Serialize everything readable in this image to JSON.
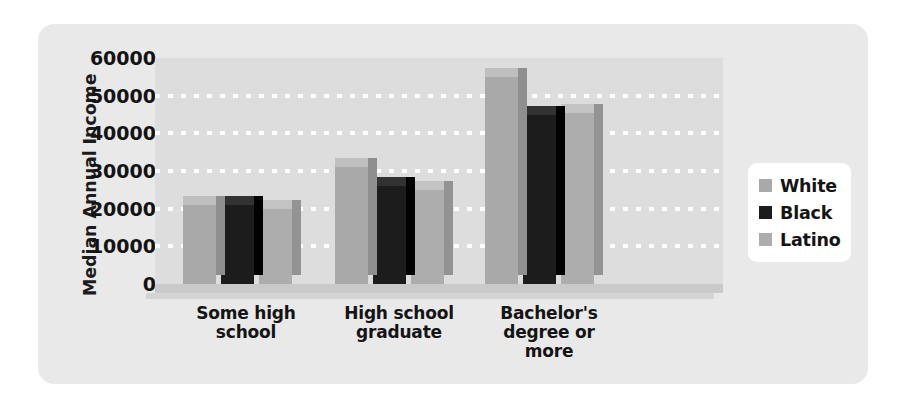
{
  "chart_data": {
    "type": "bar",
    "title": "",
    "xlabel": "",
    "ylabel": "Median Annual Income",
    "ylim": [
      0,
      60000
    ],
    "yticks": [
      60000,
      50000,
      40000,
      30000,
      20000,
      10000,
      0
    ],
    "ytick_labels": [
      "60000",
      "50000",
      "40000",
      "30000",
      "20000",
      "10000",
      "0"
    ],
    "grid": true,
    "grid_axis": "y",
    "grid_style": "dotted-white",
    "legend_position": "right",
    "three_d": true,
    "categories": [
      "Some high school",
      "High school graduate",
      "Bachelor's degree or more"
    ],
    "category_lines": [
      [
        "Some high",
        "school"
      ],
      [
        "High school",
        "graduate"
      ],
      [
        "Bachelor's",
        "degree or",
        "more"
      ]
    ],
    "series": [
      {
        "name": "White",
        "color": "#a9a9a9",
        "values": [
          21000,
          31000,
          55000
        ]
      },
      {
        "name": "Black",
        "color": "#1c1c1c",
        "values": [
          21000,
          26000,
          45000
        ]
      },
      {
        "name": "Latino",
        "color": "#adadad",
        "values": [
          20000,
          25000,
          45500
        ]
      }
    ]
  },
  "legend": {
    "entries": [
      {
        "label": "White"
      },
      {
        "label": "Black"
      },
      {
        "label": "Latino"
      }
    ]
  },
  "colors": {
    "card_background": "#e9e9e9",
    "plot_background": "#dddddd",
    "gridline": "#ffffff",
    "text": "#141414",
    "legend_background": "#ffffff",
    "white_series": "#a9a9a9",
    "black_series": "#1c1c1c",
    "latino_series": "#adadad"
  }
}
